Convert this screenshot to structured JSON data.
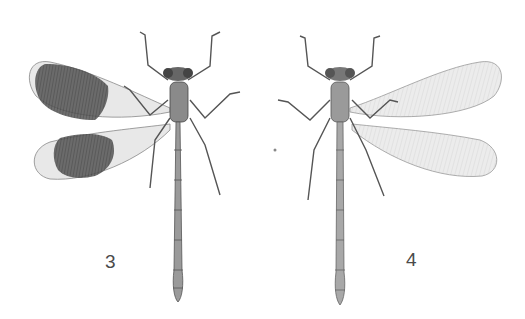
{
  "figure": {
    "specimens": [
      {
        "label": "3",
        "wings": "dark-banded",
        "wing_side": "left"
      },
      {
        "label": "4",
        "wings": "clear",
        "wing_side": "right"
      }
    ]
  },
  "colors": {
    "background": "#ffffff",
    "ink": "#3a3a3a",
    "wing_clear": "#e6e6e6",
    "wing_dark_band": "#4a4a4a",
    "body": "#8a8a8a",
    "label": "#4a4a4a"
  }
}
